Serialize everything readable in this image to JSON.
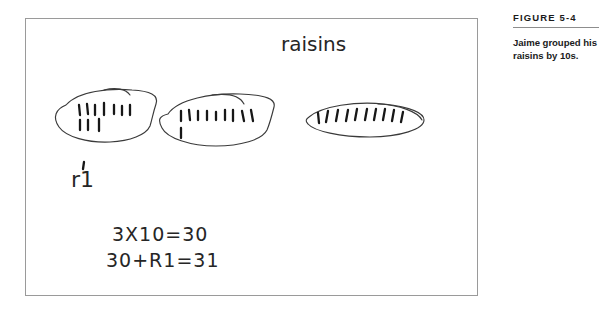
{
  "figure": {
    "number_label": "FIGURE 5-4",
    "caption": "Jaime grouped his raisins by 10s."
  },
  "work": {
    "heading_label": "raisins",
    "remainder_label": "r1",
    "equation_line_1": "3X10=30",
    "equation_line_2": "30+R1=31",
    "groups": [
      {
        "name": "group-1",
        "tally_count": 10,
        "rows": [
          7,
          3
        ]
      },
      {
        "name": "group-2",
        "tally_count": 10,
        "rows": [
          9,
          1
        ]
      },
      {
        "name": "group-3",
        "tally_count": 10,
        "rows": [
          10
        ]
      }
    ],
    "total_raisins": 31,
    "colors": {
      "ink": "#262626",
      "oval_ink": "#3a3a3a",
      "frame": "#9a9a9a",
      "rule": "#8d8d8d",
      "caption_text": "#1b1b1b",
      "paper": "#ffffff"
    }
  }
}
